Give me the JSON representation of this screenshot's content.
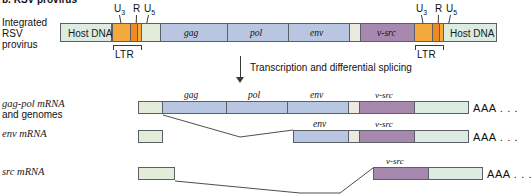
{
  "figure": {
    "cut_off_heading": "b.  RSV provirus",
    "process_label": "Transcription and differential splicing"
  },
  "rows": {
    "provirus": {
      "label_lines": [
        "Integrated",
        "RSV",
        "provirus"
      ],
      "ltr_label": "LTR",
      "u3": "U",
      "u3_sub": "3",
      "r": "R",
      "u5": "U",
      "u5_sub": "5",
      "host_left": "Host DNA",
      "host_right": "Host DNA",
      "genes": [
        "gag",
        "pol",
        "env"
      ],
      "vsrc": "v-src"
    },
    "gagpol": {
      "label_line1": "gag-pol mRNA",
      "label_line2": "and genomes",
      "genes": [
        "gag",
        "pol",
        "env"
      ],
      "vsrc": "v-src",
      "polya": "AAA . . ."
    },
    "env": {
      "label": "env mRNA",
      "genes": [
        "env"
      ],
      "vsrc": "v-src",
      "polya": "AAA . . ."
    },
    "src": {
      "label": "src mRNA",
      "vsrc": "v-src",
      "polya": "AAA . . ."
    }
  },
  "colors": {
    "host_dna": "#dcece2",
    "u3": "#f3a93c",
    "r": "#f08a20",
    "u5": "#f3a93c",
    "leader": "#e3ecd9",
    "gene": "#b9c6e2",
    "vsrc": "#a789b0",
    "gap": "#ece9df",
    "outline": "#5a5f66"
  }
}
